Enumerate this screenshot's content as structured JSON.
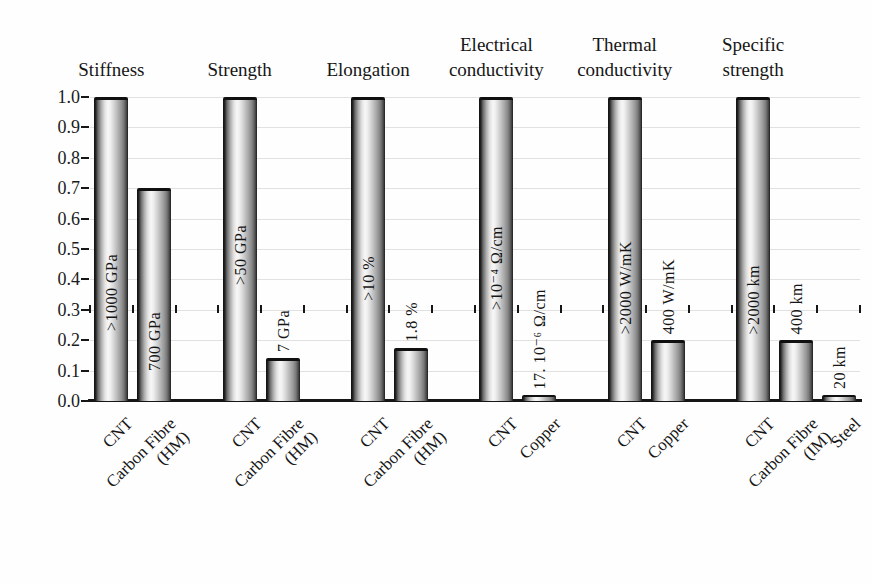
{
  "figure": {
    "background": "#fefefe",
    "text_color": "#1c1c1c",
    "axis_color": "#161616",
    "grid_color": "#dcdcdc",
    "bar_dark": "#0f0f0f",
    "bar_light": "#f7f7f7"
  },
  "chart_data": {
    "type": "bar",
    "title": "",
    "xlabel": "",
    "ylabel": "",
    "ylim": [
      0.0,
      1.0
    ],
    "grid": "horizontal",
    "legend": "none",
    "y_ticks": [
      "1.0",
      "0.9",
      "0.8",
      "0.7",
      "0.6",
      "0.5",
      "0.4",
      "0.3",
      "0.2",
      "0.1",
      "0.0"
    ],
    "groups": [
      {
        "title_lines": [
          "Stiffness"
        ],
        "bars": [
          {
            "category_lines": [
              "CNT"
            ],
            "value": 1.0,
            "annotation": ">1000 GPa",
            "annotation_placement": "inside",
            "annotation_bottom_pct": 23
          },
          {
            "category_lines": [
              "Carbon Fibre",
              "(HM)"
            ],
            "value": 0.7,
            "annotation": "700 GPa",
            "annotation_placement": "inside",
            "annotation_bottom_pct": 10
          }
        ]
      },
      {
        "title_lines": [
          "Strength"
        ],
        "bars": [
          {
            "category_lines": [
              "CNT"
            ],
            "value": 1.0,
            "annotation": ">50 GPa",
            "annotation_placement": "inside",
            "annotation_bottom_pct": 38
          },
          {
            "category_lines": [
              "Carbon Fibre",
              "(HM)"
            ],
            "value": 0.14,
            "annotation": "7 GPa",
            "annotation_placement": "above"
          }
        ]
      },
      {
        "title_lines": [
          "Elongation"
        ],
        "bars": [
          {
            "category_lines": [
              "CNT"
            ],
            "value": 1.0,
            "annotation": ">10 %",
            "annotation_placement": "inside",
            "annotation_bottom_pct": 33
          },
          {
            "category_lines": [
              "Carbon Fibre",
              "(HM)"
            ],
            "value": 0.175,
            "annotation": "1.8 %",
            "annotation_placement": "above"
          }
        ]
      },
      {
        "title_lines": [
          "Electrical",
          "conductivity"
        ],
        "bars": [
          {
            "category_lines": [
              "CNT"
            ],
            "value": 1.0,
            "annotation": ">10⁻⁴ Ω/cm",
            "annotation_placement": "inside",
            "annotation_bottom_pct": 30
          },
          {
            "category_lines": [
              "Copper"
            ],
            "value": 0.02,
            "annotation": "17. 10⁻⁶ Ω/cm",
            "annotation_placement": "above"
          }
        ]
      },
      {
        "title_lines": [
          "Thermal",
          "conductivity"
        ],
        "bars": [
          {
            "category_lines": [
              "CNT"
            ],
            "value": 1.0,
            "annotation": ">2000 W/mK",
            "annotation_placement": "inside",
            "annotation_bottom_pct": 22
          },
          {
            "category_lines": [
              "Copper"
            ],
            "value": 0.2,
            "annotation": "400 W/mK",
            "annotation_placement": "above"
          }
        ]
      },
      {
        "title_lines": [
          "Specific",
          "strength"
        ],
        "bars": [
          {
            "category_lines": [
              "CNT"
            ],
            "value": 1.0,
            "annotation": ">2000 km",
            "annotation_placement": "inside",
            "annotation_bottom_pct": 22
          },
          {
            "category_lines": [
              "Carbon Fibre",
              "(IM)"
            ],
            "value": 0.2,
            "annotation": "400 km",
            "annotation_placement": "above"
          },
          {
            "category_lines": [
              "Steel"
            ],
            "value": 0.02,
            "annotation": "20 km",
            "annotation_placement": "above"
          }
        ]
      }
    ]
  }
}
